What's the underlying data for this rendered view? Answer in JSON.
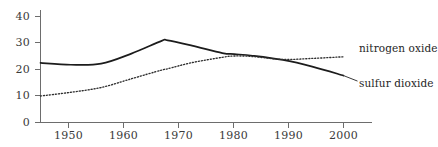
{
  "chart_data": {
    "type": "line",
    "title": "",
    "subtitle": "",
    "xlabel": "",
    "ylabel": "",
    "xlim": [
      1950,
      2000
    ],
    "ylim": [
      0,
      40
    ],
    "xticks": [
      1950,
      1960,
      1970,
      1980,
      1990,
      2000
    ],
    "xtick_labels": [
      "1950",
      "1960",
      "1970",
      "1980",
      "1990",
      "2000"
    ],
    "yticks": [
      0,
      10,
      20,
      30,
      40
    ],
    "ytick_labels": [
      "0",
      "10",
      "20",
      "30",
      "40"
    ],
    "grid": false,
    "legend_position": "right-inline-labels",
    "x": [
      1950,
      1955,
      1960,
      1965,
      1970,
      1971,
      1975,
      1980,
      1982,
      1985,
      1990,
      1995,
      2000
    ],
    "series": [
      {
        "name": "sulfur dioxide",
        "style": "solid",
        "color": "#1c1c1c",
        "values": [
          22.5,
          21.8,
          22.2,
          26.0,
          30.8,
          31.0,
          29.0,
          26.2,
          25.8,
          25.2,
          23.6,
          21.0,
          17.7
        ]
      },
      {
        "name": "nitrogen oxide",
        "style": "dotted",
        "color": "#2e2e2e",
        "values": [
          10.0,
          11.4,
          13.2,
          16.5,
          19.8,
          20.3,
          22.6,
          24.6,
          25.1,
          24.9,
          23.8,
          24.2,
          24.8
        ]
      }
    ],
    "annotations": [
      {
        "text": "nitrogen oxide",
        "series": "nitrogen oxide",
        "x": 2000,
        "y": 24.8
      },
      {
        "text": "sulfur dioxide",
        "series": "sulfur dioxide",
        "x": 2000,
        "y": 17.7
      }
    ]
  },
  "labels": {
    "nitrogen_oxide": "nitrogen oxide",
    "sulfur_dioxide": "sulfur dioxide"
  },
  "axis": {
    "y": {
      "t40": "40",
      "t30": "30",
      "t20": "20",
      "t10": "10",
      "t0": "0"
    },
    "x": {
      "t1950": "1950",
      "t1960": "1960",
      "t1970": "1970",
      "t1980": "1980",
      "t1990": "1990",
      "t2000": "2000"
    }
  },
  "colors": {
    "axis": "#6d6d6d",
    "solid_series": "#1c1c1c",
    "dotted_series": "#2e2e2e",
    "text": "#3a3a3a",
    "background": "#ffffff"
  }
}
